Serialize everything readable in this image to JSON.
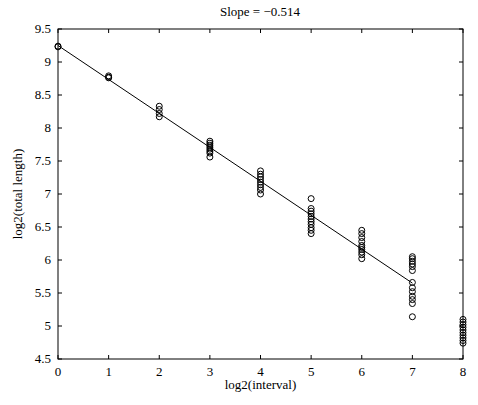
{
  "chart_data": {
    "type": "scatter",
    "title": "Slope = −0.514",
    "xlabel": "log2(interval)",
    "ylabel": "log2(total length)",
    "xlim": [
      0,
      8
    ],
    "ylim": [
      4.5,
      9.5
    ],
    "xticks": [
      "0",
      "1",
      "2",
      "3",
      "4",
      "5",
      "6",
      "7",
      "8"
    ],
    "yticks": [
      "4.5",
      "5",
      "5.5",
      "6",
      "6.5",
      "7",
      "7.5",
      "8",
      "8.5",
      "9",
      "9.5"
    ],
    "grid": false,
    "legend": null,
    "marker": "open circle",
    "series": [
      {
        "name": "data",
        "points": [
          [
            0,
            9.24
          ],
          [
            0,
            9.23
          ],
          [
            1,
            8.79
          ],
          [
            1,
            8.77
          ],
          [
            1,
            8.76
          ],
          [
            2,
            8.33
          ],
          [
            2,
            8.28
          ],
          [
            2,
            8.22
          ],
          [
            2,
            8.17
          ],
          [
            3,
            7.8
          ],
          [
            3,
            7.77
          ],
          [
            3,
            7.74
          ],
          [
            3,
            7.71
          ],
          [
            3,
            7.68
          ],
          [
            3,
            7.65
          ],
          [
            3,
            7.62
          ],
          [
            3,
            7.56
          ],
          [
            4,
            7.35
          ],
          [
            4,
            7.3
          ],
          [
            4,
            7.26
          ],
          [
            4,
            7.22
          ],
          [
            4,
            7.18
          ],
          [
            4,
            7.14
          ],
          [
            4,
            7.1
          ],
          [
            4,
            7.06
          ],
          [
            4,
            7.0
          ],
          [
            5,
            6.93
          ],
          [
            5,
            6.78
          ],
          [
            5,
            6.74
          ],
          [
            5,
            6.7
          ],
          [
            5,
            6.66
          ],
          [
            5,
            6.62
          ],
          [
            5,
            6.58
          ],
          [
            5,
            6.54
          ],
          [
            5,
            6.49
          ],
          [
            5,
            6.45
          ],
          [
            5,
            6.4
          ],
          [
            6,
            6.45
          ],
          [
            6,
            6.4
          ],
          [
            6,
            6.34
          ],
          [
            6,
            6.28
          ],
          [
            6,
            6.22
          ],
          [
            6,
            6.19
          ],
          [
            6,
            6.16
          ],
          [
            6,
            6.12
          ],
          [
            6,
            6.08
          ],
          [
            6,
            6.02
          ],
          [
            7,
            6.05
          ],
          [
            7,
            6.02
          ],
          [
            7,
            5.98
          ],
          [
            7,
            5.94
          ],
          [
            7,
            5.9
          ],
          [
            7,
            5.84
          ],
          [
            7,
            5.66
          ],
          [
            7,
            5.58
          ],
          [
            7,
            5.52
          ],
          [
            7,
            5.45
          ],
          [
            7,
            5.4
          ],
          [
            7,
            5.34
          ],
          [
            7,
            5.14
          ],
          [
            8,
            5.1
          ],
          [
            8,
            5.06
          ],
          [
            8,
            5.02
          ],
          [
            8,
            4.98
          ],
          [
            8,
            4.94
          ],
          [
            8,
            4.9
          ],
          [
            8,
            4.86
          ],
          [
            8,
            4.82
          ],
          [
            8,
            4.78
          ],
          [
            8,
            4.74
          ]
        ]
      },
      {
        "name": "fit",
        "type": "line",
        "points": [
          [
            0,
            9.25
          ],
          [
            7,
            5.65
          ]
        ],
        "slope": -0.514
      }
    ]
  }
}
